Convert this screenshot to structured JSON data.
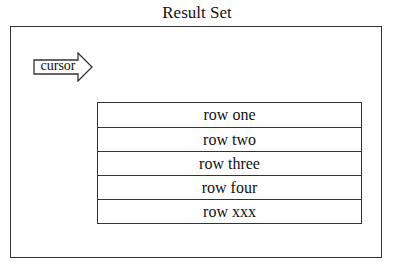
{
  "title": "Result Set",
  "cursor": {
    "label": "cursor",
    "icon": "right-arrow-icon"
  },
  "rows": [
    {
      "label": "row one"
    },
    {
      "label": "row two"
    },
    {
      "label": "row three"
    },
    {
      "label": "row four"
    },
    {
      "label": "row xxx"
    }
  ]
}
